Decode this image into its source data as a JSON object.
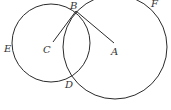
{
  "diagram": {
    "stroke_color": "#2a2a2a",
    "circles": [
      {
        "name": "circle-C",
        "cx": 51,
        "cy": 43,
        "r": 39
      },
      {
        "name": "circle-A",
        "cx": 115,
        "cy": 47,
        "r": 52
      }
    ],
    "segments": [
      {
        "name": "segment-CB",
        "x1": 53,
        "y1": 42,
        "x2": 76,
        "y2": 11
      },
      {
        "name": "segment-BA",
        "x1": 76,
        "y1": 11,
        "x2": 114,
        "y2": 43
      }
    ],
    "labels": {
      "A": "A",
      "B": "B",
      "C": "C",
      "D": "D",
      "E": "E",
      "F": "F"
    }
  }
}
